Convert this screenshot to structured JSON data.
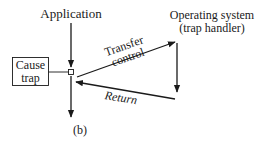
{
  "diagram": {
    "caption": "(b)",
    "nodes": {
      "application": "Application",
      "os_line1": "Operating system",
      "os_line2": "(trap handler)",
      "cause_line1": "Cause",
      "cause_line2": "trap"
    },
    "edges": {
      "transfer_line1": "Transfer",
      "transfer_line2": "control",
      "return": "Return"
    },
    "colors": {
      "ink": "#1a1a1a",
      "background": "#ffffff"
    }
  }
}
